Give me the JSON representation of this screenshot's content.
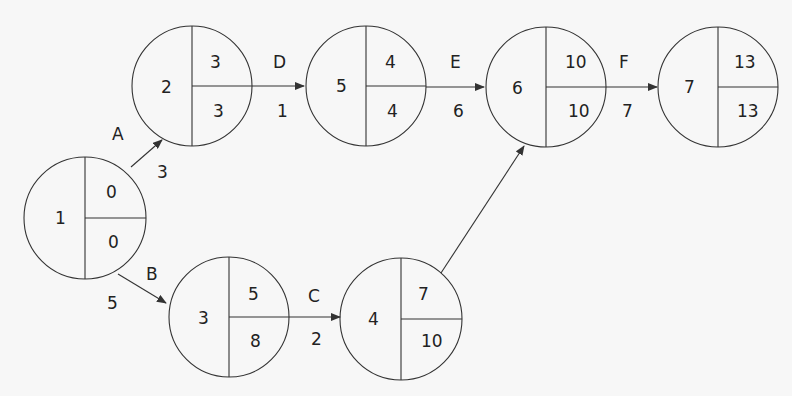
{
  "diagram": {
    "type": "activity-on-arrow network (critical path)",
    "colors": {
      "line": "#333333",
      "text": "#222222",
      "background": "#f7f7f7"
    },
    "nodes": [
      {
        "id": "1",
        "label": "1",
        "earliest": "0",
        "latest": "0",
        "cx": 85,
        "cy": 218
      },
      {
        "id": "2",
        "label": "2",
        "earliest": "3",
        "latest": "3",
        "cx": 192,
        "cy": 86
      },
      {
        "id": "3",
        "label": "3",
        "earliest": "5",
        "latest": "8",
        "cx": 229,
        "cy": 317
      },
      {
        "id": "4",
        "label": "4",
        "earliest": "7",
        "latest": "10",
        "cx": 401,
        "cy": 319
      },
      {
        "id": "5",
        "label": "5",
        "earliest": "4",
        "latest": "4",
        "cx": 366,
        "cy": 86
      },
      {
        "id": "6",
        "label": "6",
        "earliest": "10",
        "latest": "10",
        "cx": 546,
        "cy": 87
      },
      {
        "id": "7",
        "label": "7",
        "earliest": "13",
        "latest": "13",
        "cx": 718,
        "cy": 87
      }
    ],
    "edges": [
      {
        "from": "1",
        "to": "2",
        "activity": "A",
        "duration": "3"
      },
      {
        "from": "1",
        "to": "3",
        "activity": "B",
        "duration": "5"
      },
      {
        "from": "3",
        "to": "4",
        "activity": "C",
        "duration": "2"
      },
      {
        "from": "2",
        "to": "5",
        "activity": "D",
        "duration": "1"
      },
      {
        "from": "5",
        "to": "6",
        "activity": "E",
        "duration": "6"
      },
      {
        "from": "4",
        "to": "6",
        "activity": "",
        "duration": ""
      },
      {
        "from": "6",
        "to": "7",
        "activity": "F",
        "duration": "7"
      }
    ]
  }
}
